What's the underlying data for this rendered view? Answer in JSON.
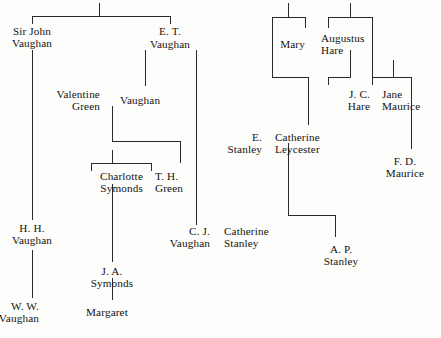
{
  "chart": {
    "kind": "genealogy-family-tree",
    "background_color": "#fdfdfb",
    "line_color": "#2a2a2a",
    "text_color": "#131313",
    "width": 441,
    "height": 338,
    "people": [
      {
        "id": "sir-john-vaughan",
        "lines": [
          "Sir John",
          "Vaughan"
        ],
        "x": 32,
        "y": 25,
        "align": "center"
      },
      {
        "id": "et-vaughan",
        "lines": [
          "E. T."
        ],
        "x": 170,
        "y": 25,
        "align": "center"
      },
      {
        "id": "et-vaughan-surname",
        "lines": [
          "Vaughan"
        ],
        "x": 170,
        "y": 38,
        "align": "center"
      },
      {
        "id": "valentine-green",
        "lines": [
          "Valentine",
          "Green"
        ],
        "x": 100,
        "y": 88,
        "align": "right"
      },
      {
        "id": "vaughan-daughter",
        "lines": [
          "Vaughan"
        ],
        "x": 120,
        "y": 94,
        "align": "left"
      },
      {
        "id": "charlotte-symonds",
        "lines": [
          "Charlotte",
          "Symonds"
        ],
        "x": 143,
        "y": 170,
        "align": "right"
      },
      {
        "id": "th-green",
        "lines": [
          "T. H.",
          "Green"
        ],
        "x": 155,
        "y": 170,
        "align": "left"
      },
      {
        "id": "hh-vaughan",
        "lines": [
          "H. H.",
          "Vaughan"
        ],
        "x": 32,
        "y": 222,
        "align": "center"
      },
      {
        "id": "ja-symonds",
        "lines": [
          "J. A.",
          "Symonds"
        ],
        "x": 112,
        "y": 265,
        "align": "center"
      },
      {
        "id": "ww-vaughan",
        "lines": [
          "W. W.",
          "Vaughan"
        ],
        "x": 39,
        "y": 300,
        "align": "right"
      },
      {
        "id": "margaret",
        "lines": [
          "Margaret"
        ],
        "x": 86,
        "y": 306,
        "align": "left"
      },
      {
        "id": "cj-vaughan",
        "lines": [
          "C. J.",
          "Vaughan"
        ],
        "x": 210,
        "y": 225,
        "align": "right"
      },
      {
        "id": "catherine-stanley",
        "lines": [
          "Catherine",
          "Stanley"
        ],
        "x": 224,
        "y": 225,
        "align": "left"
      },
      {
        "id": "mary",
        "lines": [
          "Mary"
        ],
        "x": 305,
        "y": 38,
        "align": "right"
      },
      {
        "id": "augustus-hare",
        "lines": [
          "Augustus",
          "Hare"
        ],
        "x": 321,
        "y": 32,
        "align": "left"
      },
      {
        "id": "jc-hare",
        "lines": [
          "J. C.",
          "Hare"
        ],
        "x": 370,
        "y": 88,
        "align": "right"
      },
      {
        "id": "jane-maurice",
        "lines": [
          "Jane",
          "Maurice"
        ],
        "x": 382,
        "y": 88,
        "align": "left"
      },
      {
        "id": "e-stanley",
        "lines": [
          "E.",
          "Stanley"
        ],
        "x": 262,
        "y": 131,
        "align": "right"
      },
      {
        "id": "catherine-leycester",
        "lines": [
          "Catherine",
          "Leycester"
        ],
        "x": 275,
        "y": 131,
        "align": "left"
      },
      {
        "id": "fd-maurice",
        "lines": [
          "F. D.",
          "Maurice"
        ],
        "x": 405,
        "y": 155,
        "align": "center"
      },
      {
        "id": "ap-stanley",
        "lines": [
          "A. P.",
          "Stanley"
        ],
        "x": 341,
        "y": 243,
        "align": "center"
      }
    ],
    "marriage_symbols": [
      {
        "id": "eq-et-first",
        "symbol": "=",
        "x": 145,
        "y": 44
      },
      {
        "id": "eq-et-second",
        "symbol": "=",
        "x": 196,
        "y": 44
      },
      {
        "id": "eq-green",
        "symbol": "=",
        "x": 110,
        "y": 100
      },
      {
        "id": "eq-symonds",
        "symbol": "=",
        "x": 149,
        "y": 176
      },
      {
        "id": "eq-ww-margaret",
        "symbol": "=",
        "x": 82,
        "y": 306
      },
      {
        "id": "eq-cj-vaughan",
        "symbol": "=",
        "x": 217,
        "y": 231
      },
      {
        "id": "eq-mary-hare",
        "symbol": "=",
        "x": 313,
        "y": 44
      },
      {
        "id": "eq-jc-hare",
        "symbol": "=",
        "x": 376,
        "y": 94
      },
      {
        "id": "eq-e-stanley",
        "symbol": "=",
        "x": 268,
        "y": 137
      }
    ],
    "marriage_order_labels": [
      {
        "id": "ord-first",
        "text": "1",
        "x": 145,
        "y": 27
      },
      {
        "id": "ord-second",
        "text": "2",
        "x": 199,
        "y": 27
      }
    ],
    "connectors": {
      "vertical": [
        {
          "id": "v-root-stem",
          "x": 99,
          "y": 3,
          "h": 13
        },
        {
          "id": "v-sir-john-drop",
          "x": 32,
          "y": 16,
          "h": 8
        },
        {
          "id": "v-sir-john-down",
          "x": 32,
          "y": 50,
          "h": 170
        },
        {
          "id": "v-hh-to-ww",
          "x": 32,
          "y": 250,
          "h": 48
        },
        {
          "id": "v-et-drop",
          "x": 170,
          "y": 16,
          "h": 8
        },
        {
          "id": "v-et-child",
          "x": 145,
          "y": 50,
          "h": 36
        },
        {
          "id": "v-et-second-child",
          "x": 196,
          "y": 50,
          "h": 175
        },
        {
          "id": "v-green-child",
          "x": 112,
          "y": 106,
          "h": 35
        },
        {
          "id": "v-green-right",
          "x": 180,
          "y": 141,
          "h": 22
        },
        {
          "id": "v-charlotte-stem",
          "x": 112,
          "y": 150,
          "h": 13
        },
        {
          "id": "v-charlotte-left",
          "x": 91,
          "y": 163,
          "h": 8
        },
        {
          "id": "v-charlotte-right",
          "x": 151,
          "y": 163,
          "h": 8
        },
        {
          "id": "v-symonds-down",
          "x": 112,
          "y": 184,
          "h": 78
        },
        {
          "id": "v-ja-symonds-down",
          "x": 112,
          "y": 278,
          "h": 22
        },
        {
          "id": "v-mary-stem",
          "x": 288,
          "y": 3,
          "h": 14
        },
        {
          "id": "v-mary-left",
          "x": 272,
          "y": 17,
          "h": 60
        },
        {
          "id": "v-mary-right",
          "x": 305,
          "y": 17,
          "h": 11
        },
        {
          "id": "v-hare-stem",
          "x": 350,
          "y": 3,
          "h": 14
        },
        {
          "id": "v-hare-left",
          "x": 328,
          "y": 17,
          "h": 11
        },
        {
          "id": "v-hare-right",
          "x": 372,
          "y": 17,
          "h": 60
        },
        {
          "id": "v-hare-child",
          "x": 350,
          "y": 50,
          "h": 27
        },
        {
          "id": "v-jc-hare-left",
          "x": 328,
          "y": 77,
          "h": 8
        },
        {
          "id": "v-maurice-stem",
          "x": 393,
          "y": 60,
          "h": 17
        },
        {
          "id": "v-maurice-left",
          "x": 372,
          "y": 77,
          "h": 8
        },
        {
          "id": "v-maurice-right",
          "x": 411,
          "y": 77,
          "h": 72
        },
        {
          "id": "v-catherine-drop",
          "x": 308,
          "y": 77,
          "h": 48
        },
        {
          "id": "v-leycester-child",
          "x": 288,
          "y": 143,
          "h": 72
        },
        {
          "id": "v-ap-stanley-drop",
          "x": 335,
          "y": 215,
          "h": 22
        }
      ],
      "horizontal": [
        {
          "id": "h-root-bar",
          "x": 32,
          "y": 16,
          "w": 139
        },
        {
          "id": "h-green-bar",
          "x": 112,
          "y": 141,
          "w": 69
        },
        {
          "id": "h-charlotte-bar",
          "x": 91,
          "y": 163,
          "w": 61
        },
        {
          "id": "h-mary-bar",
          "x": 272,
          "y": 17,
          "w": 34
        },
        {
          "id": "h-hare-bar",
          "x": 328,
          "y": 17,
          "w": 45
        },
        {
          "id": "h-jc-hare-bar",
          "x": 328,
          "y": 77,
          "w": 23
        },
        {
          "id": "h-maurice-bar",
          "x": 372,
          "y": 77,
          "w": 40
        },
        {
          "id": "h-leycester-bar",
          "x": 272,
          "y": 77,
          "w": 37
        },
        {
          "id": "h-stanley-bar",
          "x": 288,
          "y": 215,
          "w": 48
        }
      ]
    }
  }
}
